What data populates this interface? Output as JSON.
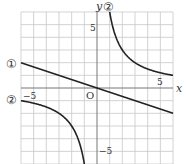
{
  "diagram": {
    "type": "coordinate-plane",
    "x_range": [
      -6,
      6
    ],
    "y_range": [
      -6,
      6
    ],
    "grid_step": 1,
    "axis_labels": {
      "x": "x",
      "y": "y",
      "origin": "O"
    },
    "tick_labels": {
      "x_pos": "5",
      "x_neg": "−5",
      "y_pos": "5",
      "y_neg": "−5"
    },
    "curves": [
      {
        "id": "1",
        "label": "①",
        "equation": "y = -x/3",
        "kind": "line"
      },
      {
        "id": "2",
        "label": "②",
        "equation": "y = 6/x",
        "kind": "hyperbola"
      }
    ],
    "colors": {
      "grid": "#c8c8c8",
      "axis": "#777777",
      "curve": "#222222",
      "text": "#333333"
    }
  },
  "chart_data": {
    "type": "line",
    "title": "",
    "xlabel": "x",
    "ylabel": "y",
    "xlim": [
      -6,
      6
    ],
    "ylim": [
      -6,
      6
    ],
    "grid": true,
    "series": [
      {
        "name": "①",
        "x": [
          -6,
          6
        ],
        "y": [
          2,
          -2
        ]
      },
      {
        "name": "② (x>0)",
        "x": [
          1,
          1.5,
          2,
          3,
          4,
          6
        ],
        "y": [
          6,
          4,
          3,
          2,
          1.5,
          1
        ]
      },
      {
        "name": "② (x<0)",
        "x": [
          -6,
          -4,
          -3,
          -2,
          -1.5,
          -1
        ],
        "y": [
          -1,
          -1.5,
          -2,
          -3,
          -4,
          -6
        ]
      }
    ]
  }
}
